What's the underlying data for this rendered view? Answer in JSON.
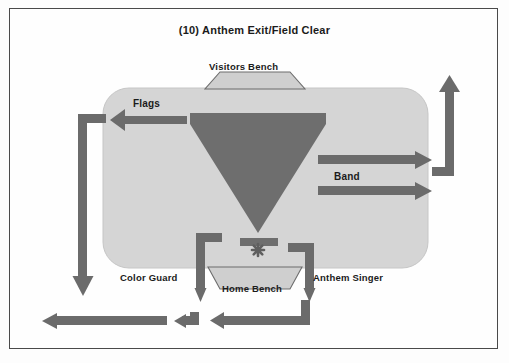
{
  "diagram": {
    "title": "(10) Anthem Exit/Field Clear",
    "type": "marching-band-field-movement-chart",
    "field": {
      "name": "football-field",
      "fill_color": "#d5d5d5",
      "outline_color": "#c2c2c2"
    },
    "colors": {
      "field": "#d5d5d5",
      "formation": "#6e6e6e",
      "arrow": "#6b6b6b",
      "bench": "#cfcfcf",
      "bench_outline": "#6d6d6d",
      "text": "#1b1b1b",
      "frame": "#4a4a4a",
      "page_background": "#fdfdfd"
    },
    "benches": [
      {
        "id": "visitors-bench",
        "label": "Visitors Bench",
        "position": "top",
        "shape": "trapezoid"
      },
      {
        "id": "home-bench",
        "label": "Home Bench",
        "position": "bottom",
        "shape": "inverted-trapezoid"
      }
    ],
    "formation": {
      "name": "inverted-triangle-block",
      "shape": "inverted-triangle",
      "front_rank": "horizontal-bar",
      "marker": "star-burst"
    },
    "labels": [
      {
        "id": "flags",
        "text": "Flags"
      },
      {
        "id": "band",
        "text": "Band"
      },
      {
        "id": "color-guard",
        "text": "Color Guard"
      },
      {
        "id": "anthem-singer",
        "text": "Anthem Singer"
      }
    ],
    "movements": [
      {
        "id": "flags-exit",
        "label": "Flags",
        "direction": "left-then-down",
        "terminates": "bottom-left"
      },
      {
        "id": "band-exit-upper",
        "label": "Band",
        "direction": "right-then-up",
        "terminates": "top-right"
      },
      {
        "id": "band-exit-lower",
        "label": "Band",
        "direction": "right",
        "terminates": "right-sideline"
      },
      {
        "id": "color-guard-exit",
        "label": "Color Guard",
        "direction": "down-then-left",
        "terminates": "bottom-left"
      },
      {
        "id": "anthem-singer-exit",
        "label": "Anthem Singer",
        "direction": "down-then-left",
        "terminates": "bottom-left"
      }
    ]
  }
}
